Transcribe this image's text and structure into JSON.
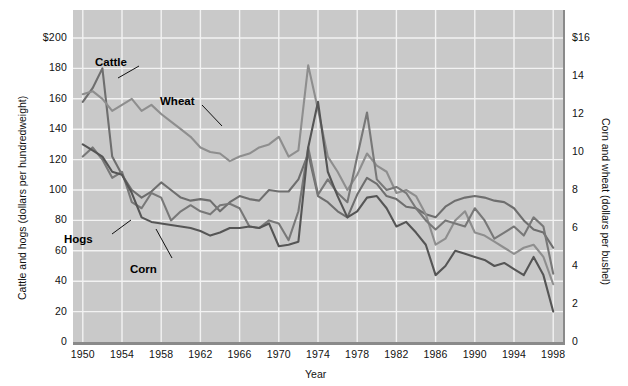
{
  "chart_data": {
    "type": "line",
    "title": "",
    "xlabel": "Year",
    "ylabel": "Cattle and hogs (dollars per hundredweight)",
    "ylabel_right": "Corn and wheat (dollars per bushel)",
    "xlim": [
      1949,
      1999
    ],
    "ylim": [
      0,
      210
    ],
    "ylim_right": [
      0,
      16.8
    ],
    "grid": true,
    "legend": "inline-annotations",
    "xticks": [
      1950,
      1954,
      1958,
      1962,
      1966,
      1970,
      1974,
      1978,
      1982,
      1986,
      1990,
      1994,
      1998
    ],
    "xticklabels": [
      "1950",
      "1954",
      "1958",
      "1962",
      "1966",
      "1970",
      "1974",
      "1978",
      "1982",
      "1986",
      "1990",
      "1994",
      "1998"
    ],
    "yticks_left": [
      0,
      20,
      40,
      60,
      80,
      100,
      120,
      140,
      160,
      180,
      200
    ],
    "yticklabels_left": [
      "0",
      "20",
      "40",
      "60",
      "80",
      "100",
      "120",
      "140",
      "160",
      "180",
      "$200"
    ],
    "yticks_right": [
      0,
      2,
      4,
      6,
      8,
      10,
      12,
      14,
      16
    ],
    "yticklabels_right": [
      "0",
      "2",
      "4",
      "6",
      "8",
      "10",
      "12",
      "14",
      "$16"
    ],
    "x": [
      1950,
      1951,
      1952,
      1953,
      1954,
      1955,
      1956,
      1957,
      1958,
      1959,
      1960,
      1961,
      1962,
      1963,
      1964,
      1965,
      1966,
      1967,
      1968,
      1969,
      1970,
      1971,
      1972,
      1973,
      1974,
      1975,
      1976,
      1977,
      1978,
      1979,
      1980,
      1981,
      1982,
      1983,
      1984,
      1985,
      1986,
      1987,
      1988,
      1989,
      1990,
      1991,
      1992,
      1993,
      1994,
      1995,
      1996,
      1997,
      1998
    ],
    "series": [
      {
        "name": "Cattle",
        "color": "#6e6e6e",
        "axis": "left",
        "units": "dollars per hundredweight",
        "values": [
          158,
          167,
          180,
          122,
          110,
          100,
          95,
          99,
          105,
          100,
          95,
          93,
          94,
          93,
          86,
          92,
          96,
          94,
          93,
          100,
          99,
          99,
          107,
          124,
          96,
          92,
          86,
          82,
          97,
          108,
          104,
          96,
          94,
          89,
          88,
          84,
          82,
          89,
          93,
          95,
          96,
          95,
          93,
          92,
          88,
          80,
          74,
          72,
          62
        ]
      },
      {
        "name": "Wheat",
        "color": "#8e8e8e",
        "axis": "right",
        "units": "dollars per bushel",
        "values": [
          163,
          165,
          160,
          152,
          156,
          160,
          152,
          156,
          150,
          145,
          140,
          135,
          128,
          125,
          124,
          119,
          122,
          124,
          128,
          130,
          135,
          122,
          126,
          182,
          153,
          122,
          112,
          100,
          110,
          124,
          116,
          112,
          98,
          100,
          96,
          84,
          64,
          68,
          80,
          86,
          72,
          70,
          66,
          62,
          58,
          62,
          64,
          56,
          38
        ]
      },
      {
        "name": "Hogs",
        "color": "#787878",
        "axis": "left",
        "units": "dollars per hundredweight",
        "values": [
          122,
          128,
          120,
          108,
          112,
          92,
          88,
          98,
          95,
          80,
          86,
          90,
          86,
          84,
          90,
          91,
          88,
          76,
          75,
          80,
          78,
          67,
          86,
          128,
          97,
          107,
          98,
          92,
          122,
          151,
          107,
          100,
          102,
          98,
          88,
          80,
          74,
          80,
          78,
          76,
          88,
          80,
          68,
          72,
          76,
          70,
          82,
          76,
          45
        ]
      },
      {
        "name": "Corn",
        "color": "#555555",
        "axis": "right",
        "units": "dollars per bushel",
        "values": [
          130,
          126,
          122,
          112,
          110,
          98,
          82,
          79,
          78,
          77,
          76,
          75,
          73,
          70,
          72,
          75,
          75,
          76,
          75,
          78,
          63,
          64,
          66,
          128,
          158,
          112,
          96,
          82,
          86,
          95,
          96,
          88,
          76,
          79,
          72,
          64,
          44,
          50,
          60,
          58,
          56,
          54,
          50,
          52,
          48,
          44,
          56,
          44,
          20
        ]
      }
    ],
    "annotations": [
      {
        "label": "Cattle",
        "x": 95,
        "y": 56
      },
      {
        "label": "Wheat",
        "x": 160,
        "y": 95
      },
      {
        "label": "Hogs",
        "x": 64,
        "y": 233
      },
      {
        "label": "Corn",
        "x": 130,
        "y": 263
      }
    ]
  }
}
